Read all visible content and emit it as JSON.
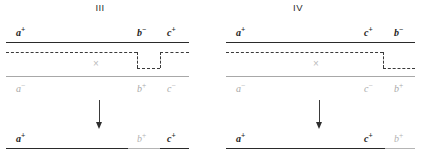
{
  "figure": {
    "background_color": "#ffffff",
    "line_dark_color": "#2a2a2a",
    "line_light_color": "#a8a8a8",
    "dash_color": "#3a3a3a",
    "faint_label_color": "#a9a9a9"
  },
  "panels": [
    {
      "id": "panel-III",
      "title": "III",
      "top_strand_labels": [
        {
          "gene": "a",
          "charge": "+"
        },
        {
          "gene": "b",
          "charge": "−"
        },
        {
          "gene": "c",
          "charge": "+"
        }
      ],
      "bottom_strand_labels": [
        {
          "gene": "a",
          "charge": "−"
        },
        {
          "gene": "b",
          "charge": "+"
        },
        {
          "gene": "c",
          "charge": "−"
        }
      ],
      "crossover_mark": "×",
      "arrow": "↓",
      "result_labels": [
        {
          "gene": "a",
          "charge": "+"
        },
        {
          "gene": "b",
          "charge": "+"
        },
        {
          "gene": "c",
          "charge": "+"
        }
      ]
    },
    {
      "id": "panel-IV",
      "title": "IV",
      "top_strand_labels": [
        {
          "gene": "a",
          "charge": "+"
        },
        {
          "gene": "c",
          "charge": "+"
        },
        {
          "gene": "b",
          "charge": "−"
        }
      ],
      "bottom_strand_labels": [
        {
          "gene": "a",
          "charge": "−"
        },
        {
          "gene": "c",
          "charge": "−"
        },
        {
          "gene": "b",
          "charge": "+"
        }
      ],
      "crossover_mark": "×",
      "arrow": "↓",
      "result_labels": [
        {
          "gene": "a",
          "charge": "+"
        },
        {
          "gene": "c",
          "charge": "+"
        },
        {
          "gene": "b",
          "charge": "+"
        }
      ]
    }
  ]
}
